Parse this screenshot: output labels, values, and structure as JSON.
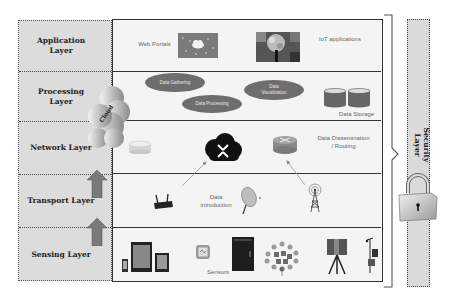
{
  "diagram": {
    "layers": [
      {
        "id": "application",
        "label": "Application Layer"
      },
      {
        "id": "processing",
        "label": "Processing Layer"
      },
      {
        "id": "network",
        "label": "Network Layer"
      },
      {
        "id": "transport",
        "label": "Transport Layer"
      },
      {
        "id": "sensing",
        "label": "Sensing Layer"
      }
    ],
    "security_layer": {
      "label": "Security Layer"
    },
    "cloud_label": "Cloud",
    "application": {
      "web_portals": "Web Portals",
      "iot_applications": "IoT applications"
    },
    "processing": {
      "data_gathering": "Data Gathering",
      "data_processing": "Data Processing",
      "data_visualization": "Data Visualization",
      "data_storage": "Data Storage"
    },
    "network": {
      "dissemination": "Data Dissemination / Routing"
    },
    "transport": {
      "introduction": "Data introduction"
    },
    "sensing": {
      "sensors": "Sensors"
    },
    "colors": {
      "left_panel": "#dcdcdc",
      "main_panel": "#f4f4f4",
      "ellipse": "#6e6e6e",
      "arrow": "#7a7a7a",
      "border": "#333333"
    }
  }
}
